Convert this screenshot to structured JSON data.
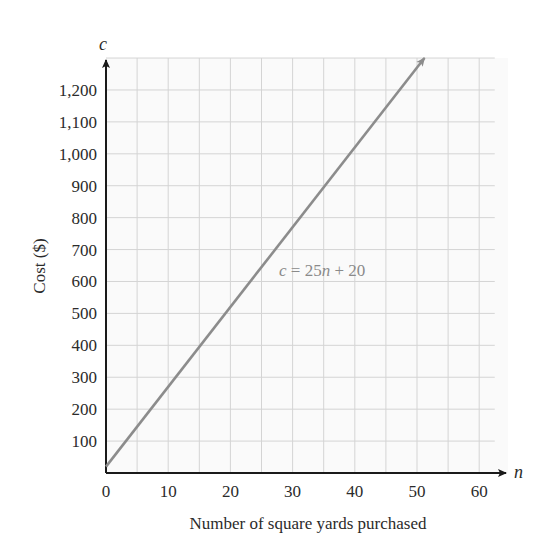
{
  "chart_data": {
    "type": "line",
    "title": "",
    "xlabel": "Number of square yards purchased",
    "ylabel": "Cost ($)",
    "x_variable": "n",
    "y_variable": "c",
    "xlim": [
      0,
      62.5
    ],
    "ylim": [
      0,
      1300
    ],
    "x_ticks": [
      0,
      10,
      20,
      30,
      40,
      50,
      60
    ],
    "x_tick_labels": [
      "0",
      "10",
      "20",
      "30",
      "40",
      "50",
      "60"
    ],
    "y_ticks": [
      100,
      200,
      300,
      400,
      500,
      600,
      700,
      800,
      900,
      1000,
      1100,
      1200
    ],
    "y_tick_labels": [
      "100",
      "200",
      "300",
      "400",
      "500",
      "600",
      "700",
      "800",
      "900",
      "1,000",
      "1,100",
      "1,200"
    ],
    "grid": true,
    "grid_x_step": 5,
    "grid_y_step": 100,
    "series": [
      {
        "name": "c = 25n + 20",
        "equation": "c = 25n + 20",
        "slope": 25,
        "intercept": 20,
        "x": [
          0,
          10,
          20,
          30,
          40,
          51.2
        ],
        "values": [
          20,
          270,
          520,
          770,
          1020,
          1300
        ],
        "color": "#8c8c8c",
        "arrow_end": true
      }
    ],
    "annotations": [
      {
        "text": "c = 25n + 20",
        "x": 27.5,
        "y": 620
      }
    ],
    "legend": "none"
  },
  "labels": {
    "y_var": "c",
    "x_var": "n",
    "x_axis": "Number of square yards purchased",
    "y_axis": "Cost ($)",
    "equation_c": "c",
    "equation_eq": " = 25",
    "equation_n": "n",
    "equation_rest": " + 20"
  },
  "colors": {
    "axis": "#1a1a1a",
    "grid": "#d4d4d4",
    "line": "#8c8c8c",
    "text": "#2b2b2b"
  }
}
